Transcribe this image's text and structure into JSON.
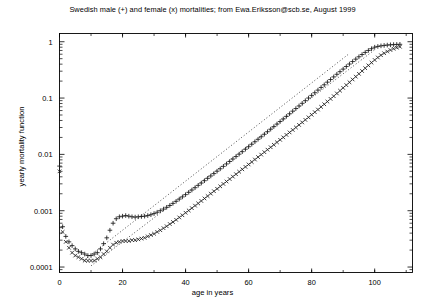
{
  "chart_data": {
    "type": "scatter",
    "title": "Swedish male (+) and female (x) mortalities; from Ewa.Eriksson@scb.se, August 1999",
    "xlabel": "age in years",
    "ylabel": "yearly mortality function",
    "yscale": "log",
    "xscale": "linear",
    "xlim": [
      0,
      112
    ],
    "ylim": [
      8e-05,
      1.4
    ],
    "grid": false,
    "legend_position": "none",
    "xticks": [
      0,
      20,
      40,
      60,
      80,
      100
    ],
    "xtick_labels": [
      "0",
      "20",
      "40",
      "60",
      "80",
      "100"
    ],
    "yticks": [
      1,
      0.1,
      0.01,
      0.001,
      0.0001
    ],
    "ytick_labels": [
      "1",
      "0.1",
      "0.01",
      "0.001",
      "0.0001"
    ],
    "series": [
      {
        "name": "Swedish male mortality",
        "marker": "+",
        "color": "#1a1a1a",
        "x": [
          0,
          1,
          2,
          3,
          4,
          5,
          6,
          7,
          8,
          9,
          10,
          11,
          12,
          13,
          14,
          15,
          16,
          17,
          18,
          19,
          20,
          21,
          22,
          23,
          24,
          25,
          26,
          27,
          28,
          29,
          30,
          31,
          32,
          33,
          34,
          35,
          36,
          37,
          38,
          39,
          40,
          41,
          42,
          43,
          44,
          45,
          46,
          47,
          48,
          49,
          50,
          51,
          52,
          53,
          54,
          55,
          56,
          57,
          58,
          59,
          60,
          61,
          62,
          63,
          64,
          65,
          66,
          67,
          68,
          69,
          70,
          71,
          72,
          73,
          74,
          75,
          76,
          77,
          78,
          79,
          80,
          81,
          82,
          83,
          84,
          85,
          86,
          87,
          88,
          89,
          90,
          91,
          92,
          93,
          94,
          95,
          96,
          97,
          98,
          99,
          100,
          101,
          102,
          103,
          104,
          105,
          106,
          107,
          108
        ],
        "y": [
          0.0062,
          0.00052,
          0.00035,
          0.00028,
          0.00024,
          0.00021,
          0.00019,
          0.00018,
          0.00017,
          0.00016,
          0.00016,
          0.00017,
          0.00018,
          0.00021,
          0.00026,
          0.00033,
          0.00045,
          0.0006,
          0.00072,
          0.00078,
          0.0008,
          0.00082,
          0.0008,
          0.00078,
          0.00077,
          0.00078,
          0.00079,
          0.0008,
          0.00082,
          0.00085,
          0.00089,
          0.00094,
          0.001,
          0.00107,
          0.00115,
          0.00124,
          0.00135,
          0.00147,
          0.00161,
          0.00176,
          0.00193,
          0.00212,
          0.00233,
          0.00256,
          0.00282,
          0.0031,
          0.00341,
          0.00376,
          0.00414,
          0.00456,
          0.00503,
          0.00555,
          0.00613,
          0.00677,
          0.00748,
          0.00827,
          0.00914,
          0.0101,
          0.01117,
          0.01236,
          0.01368,
          0.01514,
          0.01676,
          0.01856,
          0.02056,
          0.02279,
          0.02527,
          0.02803,
          0.0311,
          0.03452,
          0.03833,
          0.04258,
          0.04732,
          0.05261,
          0.05851,
          0.0651,
          0.07246,
          0.08068,
          0.08985,
          0.10009,
          0.11151,
          0.12425,
          0.13845,
          0.15428,
          0.17191,
          0.19153,
          0.21334,
          0.23754,
          0.26436,
          0.294,
          0.32669,
          0.36262,
          0.40194,
          0.44473,
          0.49094,
          0.54032,
          0.59234,
          0.64609,
          0.70012,
          0.75239,
          0.8,
          0.825,
          0.845,
          0.86,
          0.872,
          0.882,
          0.89,
          0.896,
          0.9
        ]
      },
      {
        "name": "Swedish female mortality",
        "marker": "x",
        "color": "#1a1a1a",
        "x": [
          0,
          1,
          2,
          3,
          4,
          5,
          6,
          7,
          8,
          9,
          10,
          11,
          12,
          13,
          14,
          15,
          16,
          17,
          18,
          19,
          20,
          21,
          22,
          23,
          24,
          25,
          26,
          27,
          28,
          29,
          30,
          31,
          32,
          33,
          34,
          35,
          36,
          37,
          38,
          39,
          40,
          41,
          42,
          43,
          44,
          45,
          46,
          47,
          48,
          49,
          50,
          51,
          52,
          53,
          54,
          55,
          56,
          57,
          58,
          59,
          60,
          61,
          62,
          63,
          64,
          65,
          66,
          67,
          68,
          69,
          70,
          71,
          72,
          73,
          74,
          75,
          76,
          77,
          78,
          79,
          80,
          81,
          82,
          83,
          84,
          85,
          86,
          87,
          88,
          89,
          90,
          91,
          92,
          93,
          94,
          95,
          96,
          97,
          98,
          99,
          100,
          101,
          102,
          103,
          104,
          105,
          106,
          107,
          108
        ],
        "y": [
          0.005,
          0.00042,
          0.00028,
          0.00022,
          0.00018,
          0.00016,
          0.00015,
          0.00014,
          0.00013,
          0.00013,
          0.00013,
          0.00013,
          0.00014,
          0.00015,
          0.00017,
          0.00019,
          0.00022,
          0.00025,
          0.00027,
          0.00028,
          0.00029,
          0.00029,
          0.00029,
          0.0003,
          0.0003,
          0.00031,
          0.00032,
          0.00033,
          0.00035,
          0.00037,
          0.00039,
          0.00042,
          0.00045,
          0.00049,
          0.00053,
          0.00058,
          0.00063,
          0.00069,
          0.00076,
          0.00083,
          0.00092,
          0.00101,
          0.00111,
          0.00123,
          0.00135,
          0.00149,
          0.00165,
          0.00182,
          0.00201,
          0.00222,
          0.00245,
          0.00271,
          0.00299,
          0.0033,
          0.00365,
          0.00403,
          0.00445,
          0.00492,
          0.00543,
          0.006,
          0.00663,
          0.00733,
          0.0081,
          0.00896,
          0.0099,
          0.01095,
          0.01211,
          0.01339,
          0.01481,
          0.01638,
          0.01812,
          0.02005,
          0.02218,
          0.02455,
          0.02717,
          0.03009,
          0.03334,
          0.03696,
          0.041,
          0.04551,
          0.05056,
          0.05621,
          0.06254,
          0.06965,
          0.07763,
          0.0866,
          0.09669,
          0.10805,
          0.12084,
          0.13525,
          0.1515,
          0.16982,
          0.19047,
          0.21374,
          0.23993,
          0.26938,
          0.3024,
          0.3393,
          0.3803,
          0.4254,
          0.474,
          0.525,
          0.576,
          0.625,
          0.67,
          0.712,
          0.75,
          0.785,
          0.815
        ]
      }
    ],
    "reference_lines": [
      {
        "name": "upper-gompertz-reference",
        "style": "dotted",
        "x": [
          8,
          92
        ],
        "y": [
          0.000135,
          0.62
        ]
      },
      {
        "name": "lower-gompertz-reference",
        "style": "dotted",
        "x": [
          10,
          100
        ],
        "y": [
          0.000105,
          0.72
        ]
      }
    ]
  }
}
